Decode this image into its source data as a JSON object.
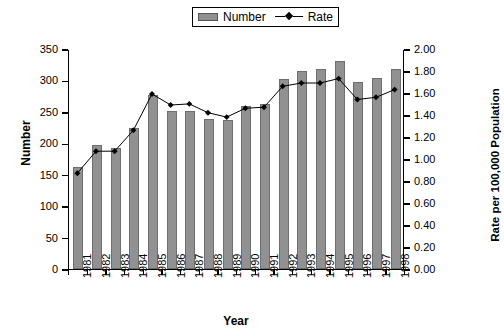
{
  "chart_data": {
    "type": "bar",
    "title": "",
    "subtitle": "",
    "xlabel": "Year",
    "ylabel": "Number",
    "y2label": "Rate per 100,000 Population",
    "categories": [
      "1981",
      "1982",
      "1983",
      "1984",
      "1985",
      "1986",
      "1987",
      "1988",
      "1989",
      "1990",
      "1991",
      "1992",
      "1993",
      "1994",
      "1995",
      "1996",
      "1997",
      "1998"
    ],
    "ylim": [
      0,
      350
    ],
    "y2lim": [
      0,
      2.0
    ],
    "yticks": [
      "0",
      "50",
      "100",
      "150",
      "200",
      "250",
      "300",
      "350"
    ],
    "ytick_values": [
      0,
      50,
      100,
      150,
      200,
      250,
      300,
      350
    ],
    "y2ticks": [
      "0.00",
      "0.20",
      "0.40",
      "0.60",
      "0.80",
      "1.00",
      "1.20",
      "1.40",
      "1.60",
      "1.80",
      "2.00"
    ],
    "y2tick_values": [
      0,
      0.2,
      0.4,
      0.6,
      0.8,
      1.0,
      1.2,
      1.4,
      1.6,
      1.8,
      2.0
    ],
    "grid": false,
    "legend_position": "top-center",
    "series": [
      {
        "name": "Number",
        "kind": "bar",
        "axis": "left",
        "color": "#919191",
        "values": [
          163,
          197,
          193,
          225,
          277,
          251,
          251,
          238,
          237,
          259,
          263,
          303,
          315,
          319,
          331,
          298,
          304,
          318
        ]
      },
      {
        "name": "Rate",
        "kind": "line",
        "axis": "right",
        "color": "#000000",
        "marker": "diamond",
        "values": [
          0.88,
          1.08,
          1.08,
          1.27,
          1.6,
          1.5,
          1.51,
          1.43,
          1.39,
          1.47,
          1.48,
          1.67,
          1.7,
          1.7,
          1.74,
          1.55,
          1.57,
          1.64
        ]
      }
    ]
  },
  "legend": {
    "items": [
      {
        "label": "Number",
        "swatch": "bar-swatch-icon"
      },
      {
        "label": "Rate",
        "swatch": "line-marker-icon"
      }
    ]
  }
}
